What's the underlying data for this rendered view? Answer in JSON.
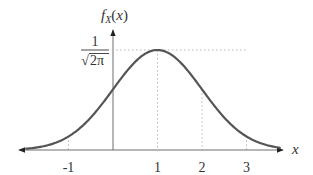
{
  "chart_data": {
    "type": "line",
    "title": "",
    "xlabel": "x",
    "ylabel": "f_X(x)",
    "ylabel_parts": {
      "main": "f",
      "sub": "X",
      "open": "(",
      "arg": "x",
      "close": ")"
    },
    "x_ticks": [
      -1,
      1,
      2,
      3
    ],
    "x_tick_labels": [
      "-1",
      "1",
      "2",
      "3"
    ],
    "y_ticks": [
      0.3989
    ],
    "y_tick_labels": [
      "1/√(2π)"
    ],
    "y_tick_label_parts": {
      "numerator": "1",
      "denominator": "2π",
      "radical": "√"
    },
    "xlim": [
      -2.2,
      3.9
    ],
    "ylim": [
      0,
      0.42
    ],
    "grid": false,
    "guides": {
      "horizontal_at_peak": true,
      "vertical_at_x": [
        -1,
        1,
        2,
        3
      ]
    },
    "series": [
      {
        "name": "f_X(x)",
        "distribution": "normal",
        "mean": 1,
        "std": 1,
        "x_range": [
          -1.95,
          3.75
        ],
        "x": [
          -1.95,
          -1,
          0,
          1,
          2,
          3,
          3.75
        ],
        "values": [
          0.0051,
          0.054,
          0.242,
          0.3989,
          0.242,
          0.054,
          0.0091
        ],
        "color": "#555555"
      }
    ],
    "axes": {
      "x_arrows": "both",
      "y_arrow": "up",
      "legend": "none"
    }
  }
}
